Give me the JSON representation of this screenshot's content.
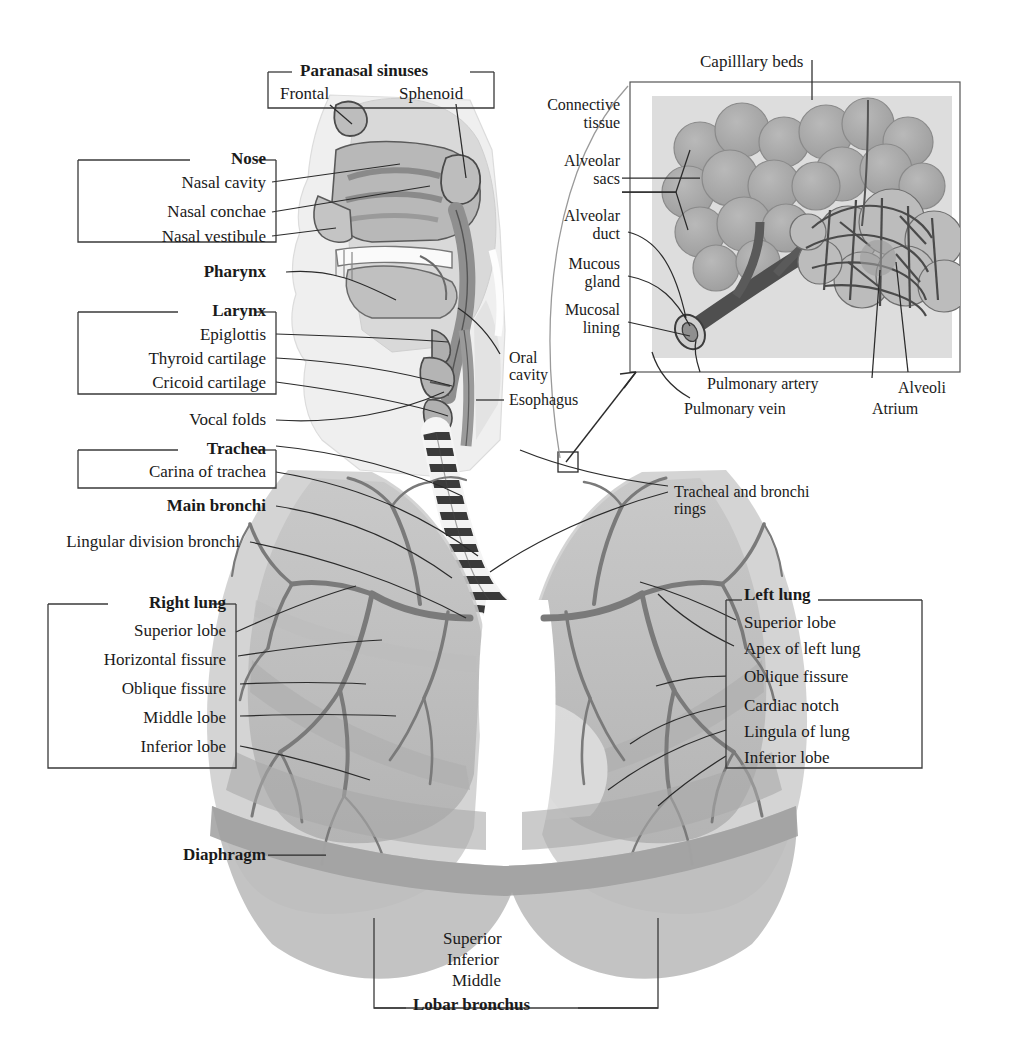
{
  "figure": {
    "kind": "anatomy-diagram",
    "background": "#ffffff",
    "ink": "#1a1a1a"
  },
  "groups": {
    "paranasal": {
      "title": "Paranasal sinuses",
      "items": [
        "Frontal",
        "Sphenoid"
      ]
    },
    "nose": {
      "title": "Nose",
      "items": [
        "Nasal cavity",
        "Nasal conchae",
        "Nasal vestibule"
      ]
    },
    "pharynx": {
      "title": "Pharynx"
    },
    "larynx": {
      "title": "Larynx",
      "items": [
        "Epiglottis",
        "Thyroid cartilage",
        "Cricoid cartilage"
      ]
    },
    "vocal_folds": {
      "title": "Vocal folds"
    },
    "trachea": {
      "title": "Trachea",
      "items": [
        "Carina of trachea"
      ]
    },
    "main_bronchi": {
      "title": "Main bronchi"
    },
    "lingular": {
      "title": "Lingular division bronchi"
    },
    "right_lung": {
      "title": "Right lung",
      "items": [
        "Superior lobe",
        "Horizontal fissure",
        "Oblique fissure",
        "Middle lobe",
        "Inferior lobe"
      ]
    },
    "left_lung": {
      "title": "Left lung",
      "items": [
        "Superior lobe",
        "Apex of left lung",
        "Oblique fissure",
        "Cardiac notch",
        "Lingula of lung",
        "Inferior lobe"
      ]
    },
    "diaphragm": {
      "title": "Diaphragm"
    },
    "lobar_bronchus": {
      "title": "Lobar bronchus",
      "items": [
        "Superior",
        "Inferior",
        "Middle"
      ]
    },
    "mid": {
      "oral_cavity_line1": "Oral",
      "oral_cavity_line2": "cavity",
      "esophagus": "Esophagus",
      "tracheal_rings_line1": "Tracheal and bronchi",
      "tracheal_rings_line2": "rings"
    }
  },
  "inset": {
    "title": "Capilllary beds",
    "left_labels": [
      {
        "line1": "Connective",
        "line2": "tissue"
      },
      {
        "line1": "Alveolar",
        "line2": "sacs"
      },
      {
        "line1": "Alveolar",
        "line2": "duct"
      },
      {
        "line1": "Mucous",
        "line2": "gland"
      },
      {
        "line1": "Mucosal",
        "line2": "lining"
      }
    ],
    "bottom_labels": [
      "Pulmonary artery",
      "Pulmonary vein",
      "Alveoli",
      "Atrium"
    ]
  }
}
